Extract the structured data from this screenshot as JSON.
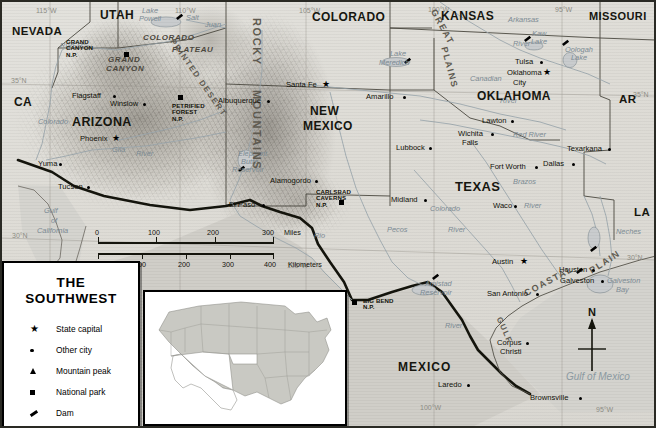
{
  "map": {
    "title": "THE SOUTHWEST",
    "projection_note": "",
    "legend": {
      "title_line1": "THE",
      "title_line2": "SOUTHWEST",
      "items": [
        {
          "symbol": "star-icon",
          "label": "State capital"
        },
        {
          "symbol": "dot-icon",
          "label": "Other city"
        },
        {
          "symbol": "triangle-icon",
          "label": "Mountain peak"
        },
        {
          "symbol": "square-icon",
          "label": "National park"
        },
        {
          "symbol": "dam-icon",
          "label": "Dam"
        }
      ]
    },
    "scale": {
      "miles_ticks": [
        "0",
        "100",
        "200",
        "300"
      ],
      "miles_unit": "Miles",
      "km_ticks": [
        "0",
        "100",
        "200",
        "300",
        "400"
      ],
      "km_unit": "Kilometers"
    },
    "compass": {
      "north_label": "N"
    },
    "colors": {
      "land": "#ddd9d2",
      "water": "#d7d6d1",
      "ink": "#15150d",
      "water_text": "#8b99a1",
      "relief_shadow": "#6e6a60",
      "legend_bg": "#ffffff",
      "frame": "#2a2a24"
    },
    "states": [
      {
        "name": "NEVADA",
        "x": 12,
        "y": 26,
        "size": 11.5
      },
      {
        "name": "UTAH",
        "x": 100,
        "y": 9,
        "size": 12
      },
      {
        "name": "COLORADO",
        "x": 312,
        "y": 11,
        "size": 12
      },
      {
        "name": "KANSAS",
        "x": 441,
        "y": 10,
        "size": 12
      },
      {
        "name": "MISSOURI",
        "x": 589,
        "y": 11,
        "size": 11
      },
      {
        "name": "CA",
        "x": 14,
        "y": 96,
        "size": 12
      },
      {
        "name": "ARIZONA",
        "x": 72,
        "y": 116,
        "size": 12.5
      },
      {
        "name": "NEW",
        "x": 310,
        "y": 105,
        "size": 12
      },
      {
        "name": "MEXICO",
        "x": 303,
        "y": 120,
        "size": 12
      },
      {
        "name": "OKLAHOMA",
        "x": 477,
        "y": 90,
        "size": 12
      },
      {
        "name": "TEXAS",
        "x": 455,
        "y": 180,
        "size": 13
      },
      {
        "name": "AR",
        "x": 619,
        "y": 94,
        "size": 11.5
      },
      {
        "name": "LA",
        "x": 634,
        "y": 207,
        "size": 11.5
      }
    ],
    "countries": [
      {
        "name": "MEXICO",
        "x": 398,
        "y": 361,
        "size": 12
      }
    ],
    "physiographic": [
      {
        "name": "ROCKY",
        "x": 262,
        "y": 18,
        "size": 11,
        "rot": 90
      },
      {
        "name": "MOUNTAINS",
        "x": 262,
        "y": 90,
        "size": 11,
        "rot": 90
      },
      {
        "name": "GREAT",
        "x": 437,
        "y": 8,
        "size": 9,
        "rot": 62
      },
      {
        "name": "PLAINS",
        "x": 448,
        "y": 46,
        "size": 9,
        "rot": 75
      },
      {
        "name": "COASTAL",
        "x": 523,
        "y": 290,
        "size": 9,
        "rot": -28
      },
      {
        "name": "PLAIN",
        "x": 588,
        "y": 268,
        "size": 9,
        "rot": -33
      },
      {
        "name": "GULF",
        "x": 502,
        "y": 316,
        "size": 8,
        "rot": 66
      },
      {
        "name": "PRINTED DESERT",
        "x": 175,
        "y": 38,
        "size": 8,
        "rot": 55
      }
    ],
    "canyons": [
      {
        "name": "GRAND",
        "x": 108,
        "y": 56
      },
      {
        "name": "CANYON",
        "x": 106,
        "y": 65
      },
      {
        "name": "COLORADO",
        "x": 143,
        "y": 34
      },
      {
        "name": "PLATEAU",
        "x": 172,
        "y": 46
      }
    ],
    "cities": [
      {
        "name": "Phoenix",
        "x": 80,
        "y": 135,
        "type": "capital",
        "anchor": "right"
      },
      {
        "name": "Tucson",
        "x": 58,
        "y": 183,
        "type": "city",
        "anchor": "right"
      },
      {
        "name": "Yuma",
        "x": 38,
        "y": 160,
        "type": "city",
        "anchor": "right"
      },
      {
        "name": "Flagstaff",
        "x": 72,
        "y": 92,
        "type": "city",
        "anchor": "right"
      },
      {
        "name": "Winslow",
        "x": 110,
        "y": 100,
        "type": "city",
        "anchor": "right"
      },
      {
        "name": "Santa Fe",
        "x": 286,
        "y": 81,
        "type": "capital",
        "anchor": "right"
      },
      {
        "name": "Albuquerque",
        "x": 218,
        "y": 97,
        "type": "city",
        "anchor": "right"
      },
      {
        "name": "Alamogordo",
        "x": 270,
        "y": 177,
        "type": "city",
        "anchor": "right"
      },
      {
        "name": "El Paso",
        "x": 229,
        "y": 201,
        "type": "city",
        "anchor": "right"
      },
      {
        "name": "Amarillo",
        "x": 366,
        "y": 93,
        "type": "city",
        "anchor": "right"
      },
      {
        "name": "Lubbock",
        "x": 396,
        "y": 144,
        "type": "city",
        "anchor": "right"
      },
      {
        "name": "Midland",
        "x": 391,
        "y": 196,
        "type": "city",
        "anchor": "right"
      },
      {
        "name": "Tulsa",
        "x": 515,
        "y": 58,
        "type": "city",
        "anchor": "right"
      },
      {
        "name": "Oklahoma",
        "x": 507,
        "y": 69,
        "type": "capital",
        "anchor": "right"
      },
      {
        "name": "City",
        "x": 513,
        "y": 79,
        "type": "none",
        "anchor": "right"
      },
      {
        "name": "Lawton",
        "x": 482,
        "y": 117,
        "type": "city",
        "anchor": "right"
      },
      {
        "name": "Wichita",
        "x": 458,
        "y": 130,
        "type": "city",
        "anchor": "right"
      },
      {
        "name": "Falls",
        "x": 462,
        "y": 139,
        "type": "none",
        "anchor": "right"
      },
      {
        "name": "Texarkana",
        "x": 567,
        "y": 145,
        "type": "city",
        "anchor": "right"
      },
      {
        "name": "Fort Worth",
        "x": 490,
        "y": 163,
        "type": "city",
        "anchor": "right"
      },
      {
        "name": "Dallas",
        "x": 543,
        "y": 160,
        "type": "city",
        "anchor": "right"
      },
      {
        "name": "Waco",
        "x": 493,
        "y": 202,
        "type": "city",
        "anchor": "right"
      },
      {
        "name": "Austin",
        "x": 492,
        "y": 258,
        "type": "capital",
        "anchor": "right"
      },
      {
        "name": "Houston",
        "x": 559,
        "y": 266,
        "type": "city",
        "anchor": "right"
      },
      {
        "name": "Galveston",
        "x": 560,
        "y": 277,
        "type": "city",
        "anchor": "right"
      },
      {
        "name": "San Antonio",
        "x": 487,
        "y": 290,
        "type": "city",
        "anchor": "right"
      },
      {
        "name": "Corpus",
        "x": 497,
        "y": 339,
        "type": "city",
        "anchor": "right"
      },
      {
        "name": "Christi",
        "x": 500,
        "y": 348,
        "type": "none",
        "anchor": "right"
      },
      {
        "name": "Laredo",
        "x": 438,
        "y": 381,
        "type": "city",
        "anchor": "right"
      },
      {
        "name": "Brownsville",
        "x": 530,
        "y": 394,
        "type": "city",
        "anchor": "right"
      }
    ],
    "parks": [
      {
        "name": "GRAND\nCANYON\nN.P.",
        "x": 66,
        "y": 39,
        "mx": 124,
        "my": 52
      },
      {
        "name": "PETRIFIED\nFOREST\nN.P.",
        "x": 172,
        "y": 103,
        "mx": 178,
        "my": 95
      },
      {
        "name": "CARLSBAD\nCAVERNS\nN.P.",
        "x": 316,
        "y": 189,
        "mx": 339,
        "my": 200
      },
      {
        "name": "BIG BEND\nN.P.",
        "x": 363,
        "y": 298,
        "mx": 352,
        "my": 300
      }
    ],
    "water_features": [
      {
        "name": "Lake",
        "x": 142,
        "y": 7,
        "cls": "water"
      },
      {
        "name": "Powell",
        "x": 139,
        "y": 15,
        "cls": "water"
      },
      {
        "name": "Salt",
        "x": 186,
        "y": 14,
        "cls": "water"
      },
      {
        "name": "Juan",
        "x": 205,
        "y": 21,
        "cls": "water"
      },
      {
        "name": "Lake",
        "x": 390,
        "y": 50,
        "cls": "water"
      },
      {
        "name": "Meredich",
        "x": 379,
        "y": 59,
        "cls": "water"
      },
      {
        "name": "Kaw",
        "x": 532,
        "y": 30,
        "cls": "water"
      },
      {
        "name": "Lake",
        "x": 531,
        "y": 38,
        "cls": "water"
      },
      {
        "name": "Oologah",
        "x": 565,
        "y": 46,
        "cls": "water"
      },
      {
        "name": "Lake",
        "x": 571,
        "y": 54,
        "cls": "water"
      },
      {
        "name": "Elephant",
        "x": 238,
        "y": 150,
        "cls": "water"
      },
      {
        "name": "Butte",
        "x": 241,
        "y": 158,
        "cls": "water"
      },
      {
        "name": "Reservoir",
        "x": 232,
        "y": 166,
        "cls": "water"
      },
      {
        "name": "Amistad",
        "x": 425,
        "y": 280,
        "cls": "water"
      },
      {
        "name": "Reservoir",
        "x": 420,
        "y": 289,
        "cls": "water"
      },
      {
        "name": "Galveston",
        "x": 607,
        "y": 277,
        "cls": "water"
      },
      {
        "name": "Bay",
        "x": 616,
        "y": 286,
        "cls": "water"
      },
      {
        "name": "Gulf",
        "x": 44,
        "y": 207,
        "cls": "water"
      },
      {
        "name": "of",
        "x": 51,
        "y": 217,
        "cls": "water"
      },
      {
        "name": "California",
        "x": 37,
        "y": 227,
        "cls": "water"
      },
      {
        "name": "Gulf of Mexico",
        "x": 566,
        "y": 372,
        "cls": "water-big"
      },
      {
        "name": "Colorado",
        "x": 430,
        "y": 205,
        "cls": "water"
      },
      {
        "name": "River",
        "x": 448,
        "y": 226,
        "cls": "water"
      },
      {
        "name": "Brazos",
        "x": 513,
        "y": 178,
        "cls": "water"
      },
      {
        "name": "River",
        "x": 524,
        "y": 202,
        "cls": "water"
      },
      {
        "name": "Red River",
        "x": 513,
        "y": 131,
        "cls": "water"
      },
      {
        "name": "Canadian",
        "x": 470,
        "y": 75,
        "cls": "water"
      },
      {
        "name": "River",
        "x": 500,
        "y": 97,
        "cls": "water"
      },
      {
        "name": "Arkansas",
        "x": 508,
        "y": 16,
        "cls": "water"
      },
      {
        "name": "River",
        "x": 513,
        "y": 40,
        "cls": "water"
      },
      {
        "name": "Neches",
        "x": 616,
        "y": 228,
        "cls": "water"
      },
      {
        "name": "Rio",
        "x": 314,
        "y": 232,
        "cls": "water"
      },
      {
        "name": "Pecos",
        "x": 387,
        "y": 226,
        "cls": "water"
      },
      {
        "name": "Gila",
        "x": 112,
        "y": 146,
        "cls": "water"
      },
      {
        "name": "River",
        "x": 136,
        "y": 150,
        "cls": "water"
      },
      {
        "name": "Colorado",
        "x": 38,
        "y": 118,
        "cls": "water"
      },
      {
        "name": "RIVER",
        "x": 60,
        "y": 42,
        "cls": "water"
      },
      {
        "name": "River",
        "x": 445,
        "y": 322,
        "cls": "water"
      }
    ],
    "coordinates": [
      {
        "label": "115°W",
        "x": 36,
        "y": 7
      },
      {
        "label": "110°W",
        "x": 175,
        "y": 7
      },
      {
        "label": "105°W",
        "x": 299,
        "y": 7
      },
      {
        "label": "100°W",
        "x": 428,
        "y": 6
      },
      {
        "label": "95°W",
        "x": 555,
        "y": 6
      },
      {
        "label": "35°N",
        "x": 11,
        "y": 77
      },
      {
        "label": "35°N",
        "x": 633,
        "y": 91
      },
      {
        "label": "30°N",
        "x": 12,
        "y": 232
      },
      {
        "label": "30°N",
        "x": 627,
        "y": 254
      },
      {
        "label": "105°W",
        "x": 287,
        "y": 262
      },
      {
        "label": "100°W",
        "x": 420,
        "y": 404
      },
      {
        "label": "95°W",
        "x": 596,
        "y": 406
      }
    ]
  }
}
